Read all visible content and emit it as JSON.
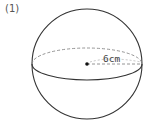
{
  "problem": {
    "number_label": "(1)"
  },
  "figure": {
    "shape": "sphere",
    "radius_label": "6cm",
    "colors": {
      "stroke": "#333333",
      "dashed": "#888888",
      "text": "#444444"
    }
  }
}
